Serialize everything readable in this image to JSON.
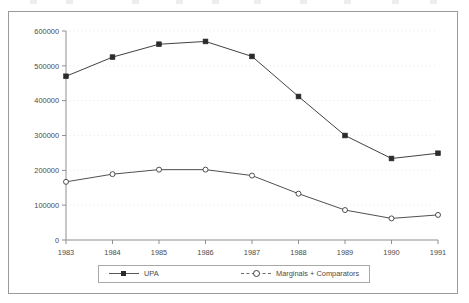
{
  "chart_data": {
    "type": "line",
    "title": "",
    "subtitle": "",
    "xlabel": "",
    "ylabel": "",
    "categories": [
      "1983",
      "1984",
      "1985",
      "1986",
      "1987",
      "1988",
      "1989",
      "1990",
      "1991"
    ],
    "x": [
      1983,
      1984,
      1985,
      1986,
      1987,
      1988,
      1989,
      1990,
      1991
    ],
    "series": [
      {
        "name": "UPA",
        "marker": "filled-square",
        "color": "#2b2b2b",
        "values": [
          470000,
          525000,
          562000,
          570000,
          527000,
          412000,
          300000,
          234000,
          249000
        ]
      },
      {
        "name": "Marginals + Comparators",
        "marker": "open-circle",
        "color": "#3c3c3c",
        "values": [
          167000,
          189000,
          202000,
          202000,
          185000,
          133000,
          86000,
          62000,
          72000
        ]
      }
    ],
    "ylim": [
      0,
      600000
    ],
    "ytick_values": [
      0,
      100000,
      200000,
      300000,
      400000,
      500000,
      600000
    ],
    "ytick_labels": [
      "0",
      "100000",
      "200000",
      "300000",
      "400000",
      "500000",
      "600000"
    ],
    "xtick_labels": [
      "1983",
      "1984",
      "1985",
      "1986",
      "1987",
      "1988",
      "1989",
      "1990",
      "1991"
    ],
    "grid": {
      "horizontal": true,
      "vertical": false,
      "style": "dotted",
      "color": "#e9e9e9"
    },
    "legend": {
      "position": "bottom",
      "entries": [
        {
          "label": "UPA",
          "marker": "filled-square"
        },
        {
          "label": "Marginals + Comparators",
          "marker": "open-circle"
        }
      ]
    },
    "axis_color": "#8f8f8f",
    "frame_color": "#9a9a9a",
    "background": "#ffffff"
  },
  "legend": {
    "upa_label": "UPA",
    "marginals_label": "Marginals + Comparators"
  }
}
